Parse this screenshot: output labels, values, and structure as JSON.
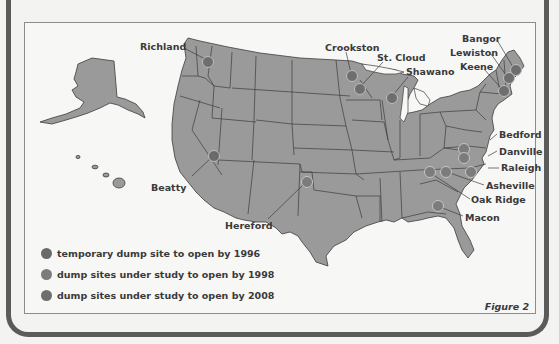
{
  "figure_caption": "Figure 2",
  "colors": {
    "land": "#9a9a9a",
    "border": "#3c3c3c",
    "background": "#f7f7f5",
    "frame": "#5b5b5b",
    "dot_1996": "#6a6a6a",
    "dot_1998": "#7c7c7c",
    "dot_2008": "#6e6e6e"
  },
  "legend": [
    {
      "label": "temporary dump site to open by 1996",
      "color": "#6a6a6a"
    },
    {
      "label": "dump sites under study to open by 1998",
      "color": "#7c7c7c"
    },
    {
      "label": "dump sites under study to open by 2008",
      "color": "#6e6e6e"
    }
  ],
  "sites": [
    {
      "name": "Richland",
      "label_pos": [
        140,
        42
      ],
      "dot": [
        207,
        61
      ]
    },
    {
      "name": "Beatty",
      "label_pos": [
        151,
        183
      ],
      "dot": [
        213,
        155
      ]
    },
    {
      "name": "Hereford",
      "label_pos": [
        225,
        225
      ],
      "dot": [
        306,
        181
      ]
    },
    {
      "name": "Crookston",
      "label_pos": [
        325,
        43
      ],
      "dot": [
        351,
        75
      ]
    },
    {
      "name": "St. Cloud",
      "label_pos": [
        377,
        53
      ],
      "dot": [
        359,
        88
      ]
    },
    {
      "name": "Shawano",
      "label_pos": [
        406,
        69
      ],
      "dot": [
        391,
        97
      ]
    },
    {
      "name": "Bangor",
      "label_pos": [
        464,
        34
      ],
      "dot": [
        515,
        69
      ]
    },
    {
      "name": "Lewiston",
      "label_pos": [
        451,
        48
      ],
      "dot": [
        508,
        77
      ]
    },
    {
      "name": "Keene",
      "label_pos": [
        461,
        62
      ],
      "dot": [
        503,
        90
      ]
    },
    {
      "name": "Bedford",
      "label_pos": [
        499,
        130
      ],
      "dot": [
        463,
        148
      ]
    },
    {
      "name": "Danville",
      "label_pos": [
        499,
        147
      ],
      "dot": [
        463,
        156
      ]
    },
    {
      "name": "Raleigh",
      "label_pos": [
        501,
        164
      ],
      "dot": [
        470,
        171
      ]
    },
    {
      "name": "Asheville",
      "label_pos": [
        486,
        181
      ],
      "dot": [
        445,
        171
      ]
    },
    {
      "name": "Oak Ridge",
      "label_pos": [
        472,
        195
      ],
      "dot": [
        429,
        171
      ]
    },
    {
      "name": "Macon",
      "label_pos": [
        465,
        213
      ],
      "dot": [
        437,
        205
      ]
    }
  ]
}
